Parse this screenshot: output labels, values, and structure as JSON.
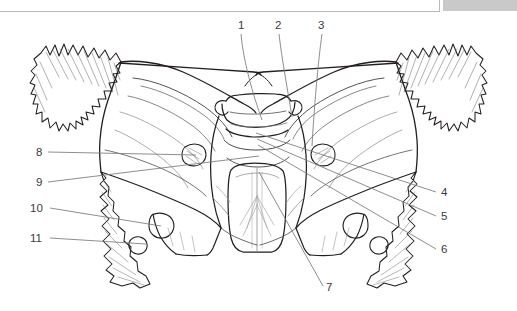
{
  "figure": {
    "illustration_style": "line-drawing",
    "line_color": "#231f20",
    "leader_line_color": "#7a7a7a",
    "label_text_color": "#3b3b3b",
    "background_color": "#ffffff",
    "accent_gray": "#c9c9c9"
  },
  "top_frame": {
    "border_color": "#b9b9bd",
    "gray_bar_color": "#c9c9c9"
  },
  "callouts": [
    {
      "id": "1",
      "label": "1",
      "x": 240,
      "y": 22,
      "anchor_x": 262,
      "anchor_y": 120
    },
    {
      "id": "2",
      "label": "2",
      "x": 277,
      "y": 22,
      "anchor_x": 291,
      "anchor_y": 118
    },
    {
      "id": "3",
      "label": "3",
      "x": 319,
      "y": 22,
      "anchor_x": 312,
      "anchor_y": 145
    },
    {
      "id": "4",
      "label": "4",
      "x": 441,
      "y": 194,
      "anchor_x": 255,
      "anchor_y": 133
    },
    {
      "id": "5",
      "label": "5",
      "x": 441,
      "y": 218,
      "anchor_x": 256,
      "anchor_y": 139
    },
    {
      "id": "6",
      "label": "6",
      "x": 441,
      "y": 251,
      "anchor_x": 257,
      "anchor_y": 145
    },
    {
      "id": "7",
      "label": "7",
      "x": 326,
      "y": 288,
      "anchor_x": 258,
      "anchor_y": 172
    },
    {
      "id": "8",
      "label": "8",
      "x": 36,
      "y": 150,
      "anchor_x": 196,
      "anchor_y": 155
    },
    {
      "id": "9",
      "label": "9",
      "x": 36,
      "y": 180,
      "anchor_x": 259,
      "anchor_y": 156
    },
    {
      "id": "10",
      "label": "10",
      "x": 30,
      "y": 206,
      "anchor_x": 160,
      "anchor_y": 225
    },
    {
      "id": "11",
      "label": "11",
      "x": 30,
      "y": 236,
      "anchor_x": 145,
      "anchor_y": 244
    }
  ]
}
